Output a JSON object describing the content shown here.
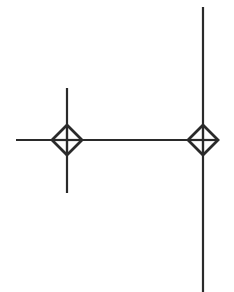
{
  "diagram": {
    "width": 234,
    "height": 292,
    "background": "#ffffff",
    "stroke_color": "#2a2a2a",
    "stroke_width": 2.2,
    "lines": [
      {
        "name": "main-horizontal-line",
        "x1": 16,
        "y1": 140,
        "x2": 203,
        "y2": 140
      },
      {
        "name": "left-vertical-stub",
        "x1": 67,
        "y1": 88,
        "x2": 67,
        "y2": 193
      },
      {
        "name": "right-vertical-line",
        "x1": 203,
        "y1": 7,
        "x2": 203,
        "y2": 292
      }
    ],
    "junctions": [
      {
        "name": "left-junction-diamond",
        "cx": 67,
        "cy": 140,
        "r": 15
      },
      {
        "name": "right-junction-diamond",
        "cx": 203,
        "cy": 140,
        "r": 15
      }
    ]
  }
}
